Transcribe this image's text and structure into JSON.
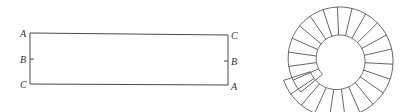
{
  "figure": {
    "rectangle_strip": {
      "left_labels": [
        "A",
        "B",
        "C"
      ],
      "right_labels": [
        "C",
        "B",
        "A"
      ]
    },
    "spiral_strip": {
      "description": "strip wound into a ring with radial rungs",
      "rung_count": 24
    }
  },
  "colors": {
    "line": "#4a4a4a",
    "label": "#333333",
    "background": "#ffffff"
  }
}
